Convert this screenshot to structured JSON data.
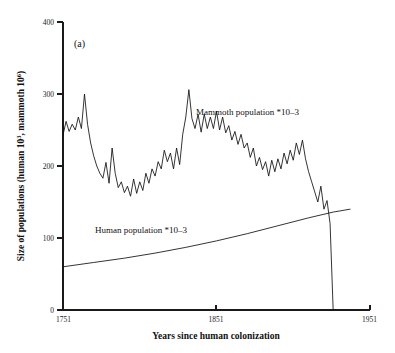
{
  "figure": {
    "panel_label": "(a)",
    "background": "#ffffff",
    "line_color": "#111111",
    "axis_color": "#1a1a1a"
  },
  "chart_data": {
    "type": "line",
    "title": "",
    "xlabel": "Years since human colonization",
    "ylabel": "Size of populations (human 10³, mammoth 10⁶)",
    "ylabel_parts": {
      "prefix": "Size of populations (human 10",
      "sup1": "3",
      "middle": ", mammoth 10",
      "sup2": "6",
      "suffix": ")"
    },
    "xlim": [
      1751,
      1951
    ],
    "ylim": [
      0,
      400
    ],
    "xticks": [
      1751,
      1851,
      1951
    ],
    "xtick_labels": [
      "1751",
      "1851",
      "1951"
    ],
    "yticks": [
      0,
      100,
      200,
      300,
      400
    ],
    "ytick_labels": [
      "0",
      "100",
      "200",
      "300",
      "400"
    ],
    "grid": false,
    "legend_position": "inline-annotations",
    "annotations": [
      {
        "name": "mammoth-series-label",
        "text": "Mammoth population *10–3",
        "x": 1815,
        "y": 268
      },
      {
        "name": "human-series-label",
        "text": "Human population *10–3",
        "x": 1790,
        "y": 128
      }
    ],
    "series": [
      {
        "name": "Mammoth population *10–3",
        "units": "mammoth 10^6",
        "x": [
          1751,
          1753,
          1755,
          1757,
          1759,
          1761,
          1763,
          1765,
          1767,
          1769,
          1771,
          1773,
          1775,
          1777,
          1779,
          1781,
          1783,
          1785,
          1787,
          1789,
          1791,
          1793,
          1795,
          1797,
          1799,
          1801,
          1803,
          1805,
          1807,
          1809,
          1811,
          1813,
          1815,
          1817,
          1819,
          1821,
          1823,
          1825,
          1827,
          1829,
          1831,
          1833,
          1835,
          1837,
          1839,
          1841,
          1843,
          1845,
          1847,
          1849,
          1851,
          1853,
          1855,
          1857,
          1859,
          1861,
          1863,
          1865,
          1867,
          1869,
          1871,
          1873,
          1875,
          1877,
          1879,
          1881,
          1883,
          1885,
          1887,
          1889,
          1891,
          1893,
          1895,
          1897,
          1899,
          1901,
          1903,
          1905,
          1907,
          1909,
          1911,
          1913,
          1915,
          1917,
          1919,
          1921,
          1923,
          1925,
          1927
        ],
        "y": [
          243,
          262,
          248,
          258,
          250,
          268,
          252,
          300,
          258,
          232,
          214,
          200,
          190,
          183,
          205,
          176,
          225,
          190,
          170,
          178,
          163,
          172,
          158,
          182,
          162,
          178,
          166,
          190,
          176,
          196,
          186,
          206,
          196,
          222,
          206,
          218,
          196,
          225,
          202,
          244,
          268,
          306,
          266,
          252,
          272,
          247,
          272,
          252,
          268,
          252,
          276,
          250,
          268,
          246,
          256,
          236,
          248,
          230,
          244,
          225,
          232,
          212,
          225,
          200,
          212,
          195,
          206,
          186,
          208,
          192,
          210,
          196,
          218,
          203,
          222,
          208,
          232,
          216,
          236,
          210,
          192,
          178,
          164,
          150,
          172,
          140,
          152,
          120,
          0
        ]
      },
      {
        "name": "Human population *10–3",
        "units": "human 10^3",
        "x": [
          1751,
          1771,
          1791,
          1811,
          1831,
          1851,
          1871,
          1891,
          1911,
          1927,
          1938
        ],
        "y": [
          60,
          66,
          72,
          79,
          87,
          96,
          106,
          117,
          128,
          136,
          140
        ]
      }
    ]
  }
}
